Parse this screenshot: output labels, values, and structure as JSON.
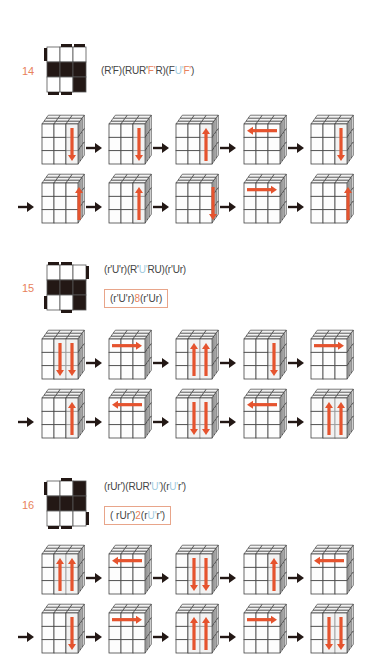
{
  "colors": {
    "accent_orange": "#e8825c",
    "accent_blue": "#9fcbe0",
    "dark": "#231815",
    "move_arrow": "#e5532e"
  },
  "cases": [
    {
      "number": "14",
      "pattern": {
        "grid": [
          [
            0,
            0,
            0
          ],
          [
            1,
            1,
            1
          ],
          [
            0,
            0,
            1
          ]
        ],
        "side_bars": [
          "top-mid",
          "top-right",
          "left-top",
          "bottom-left",
          "bottom-mid"
        ]
      },
      "formula_segments": [
        {
          "t": "(R'F)(RUR'",
          "c": "n"
        },
        {
          "t": "F'",
          "c": "o"
        },
        {
          "t": "R)(F",
          "c": "n"
        },
        {
          "t": "U'",
          "c": "b"
        },
        {
          "t": "F'",
          "c": "o"
        },
        {
          "t": ")",
          "c": "n"
        }
      ],
      "formula": "(R'F)(RUR'F'R)(FU'F')",
      "short_formula": null,
      "rows": [
        {
          "lead_arrow": false,
          "moves": [
            "right-col-down",
            "right-col-down",
            "right-col-up",
            "top-row-left",
            "right-col-down"
          ]
        },
        {
          "lead_arrow": true,
          "moves": [
            "right-edge-up",
            "right-col-up",
            "right-edge-down",
            "top-row-right",
            "right-edge-up"
          ]
        }
      ]
    },
    {
      "number": "15",
      "pattern": {
        "grid": [
          [
            0,
            0,
            0
          ],
          [
            1,
            1,
            1
          ],
          [
            0,
            0,
            1
          ]
        ],
        "side_bars": [
          "top-left",
          "top-mid",
          "right-top",
          "left-bottom",
          "bottom-mid"
        ]
      },
      "formula_segments": [
        {
          "t": "(r'U'r)(R'",
          "c": "n"
        },
        {
          "t": "U'",
          "c": "b"
        },
        {
          "t": "RU)(r'Ur)",
          "c": "n"
        }
      ],
      "formula": "(r'U'r)(R'U'RU)(r'Ur)",
      "short_formula_segments": [
        {
          "t": "(r'U'r)",
          "c": "n"
        },
        {
          "t": "8",
          "c": "o"
        },
        {
          "t": "(r'Ur)",
          "c": "n"
        }
      ],
      "short_formula": "(r'U'r)8(r'Ur)",
      "rows": [
        {
          "lead_arrow": false,
          "moves": [
            "two-cols-down",
            "top-row-right",
            "two-cols-up",
            "right-col-down",
            "top-row-right"
          ]
        },
        {
          "lead_arrow": true,
          "moves": [
            "right-col-up",
            "top-row-left",
            "two-cols-down",
            "top-row-left",
            "two-cols-up"
          ]
        }
      ]
    },
    {
      "number": "16",
      "pattern": {
        "grid": [
          [
            0,
            0,
            1
          ],
          [
            1,
            1,
            1
          ],
          [
            0,
            0,
            0
          ]
        ],
        "side_bars": [
          "top-mid",
          "left-top",
          "right-bottom",
          "bottom-left",
          "bottom-mid"
        ]
      },
      "formula_segments": [
        {
          "t": "(rUr')(RUR'",
          "c": "n"
        },
        {
          "t": "U'",
          "c": "b"
        },
        {
          "t": ")(r",
          "c": "n"
        },
        {
          "t": "U'",
          "c": "b"
        },
        {
          "t": "r')",
          "c": "n"
        }
      ],
      "formula": "(rUr')(RUR'U')(rU'r')",
      "short_formula_segments": [
        {
          "t": "( rUr')",
          "c": "n"
        },
        {
          "t": "2",
          "c": "o"
        },
        {
          "t": "(r",
          "c": "n"
        },
        {
          "t": "U'",
          "c": "b"
        },
        {
          "t": "r')",
          "c": "n"
        }
      ],
      "short_formula": "( rUr')2(rU'r')",
      "rows": [
        {
          "lead_arrow": false,
          "moves": [
            "two-cols-up",
            "top-row-left",
            "two-cols-down",
            "right-col-up",
            "top-row-left"
          ]
        },
        {
          "lead_arrow": true,
          "moves": [
            "right-col-down",
            "top-row-right",
            "two-cols-up",
            "top-row-right",
            "two-cols-down"
          ]
        }
      ]
    }
  ]
}
